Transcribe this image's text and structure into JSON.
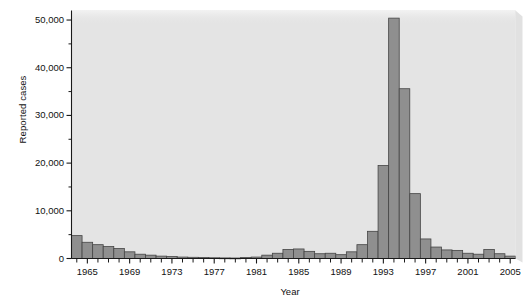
{
  "chart_data": {
    "type": "bar",
    "title": "",
    "xlabel": "Year",
    "ylabel": "Reported cases",
    "ylim": [
      0,
      52000
    ],
    "xlim": [
      1963.5,
      2005.5
    ],
    "grid": false,
    "legend": null,
    "y_ticks": [
      0,
      10000,
      20000,
      30000,
      40000,
      50000
    ],
    "y_tick_labels": [
      "0",
      "10,000",
      "20,000",
      "30,000",
      "40,000",
      "50,000"
    ],
    "y_minor_ticks": [
      5000,
      15000,
      25000,
      35000,
      45000
    ],
    "x_ticks": [
      1965,
      1969,
      1973,
      1977,
      1981,
      1985,
      1989,
      1993,
      1997,
      2001,
      2005
    ],
    "x_tick_labels": [
      "1965",
      "1969",
      "1973",
      "1977",
      "1981",
      "1985",
      "1989",
      "1993",
      "1997",
      "2001",
      "2005"
    ],
    "bar_fill": "#8f8f8f",
    "bar_stroke": "#454545",
    "plot_background": "#e4e4e4",
    "axis_color": "#1a1a1a",
    "categories": [
      1964,
      1965,
      1966,
      1967,
      1968,
      1969,
      1970,
      1971,
      1972,
      1973,
      1974,
      1975,
      1976,
      1977,
      1978,
      1979,
      1980,
      1981,
      1982,
      1983,
      1984,
      1985,
      1986,
      1987,
      1988,
      1989,
      1990,
      1991,
      1992,
      1993,
      1994,
      1995,
      1996,
      1997,
      1998,
      1999,
      2000,
      2001,
      2002,
      2003,
      2004,
      2005
    ],
    "values": [
      4800,
      3400,
      2900,
      2500,
      2100,
      1400,
      900,
      700,
      500,
      400,
      300,
      250,
      200,
      150,
      120,
      100,
      200,
      300,
      700,
      1100,
      1900,
      2000,
      1500,
      1000,
      1100,
      800,
      1400,
      2900,
      5700,
      19500,
      50400,
      35600,
      13600,
      4100,
      2400,
      1800,
      1700,
      1100,
      900,
      1900,
      1000,
      500
    ]
  },
  "axes": {
    "y_title": "Reported cases",
    "x_title": "Year"
  }
}
